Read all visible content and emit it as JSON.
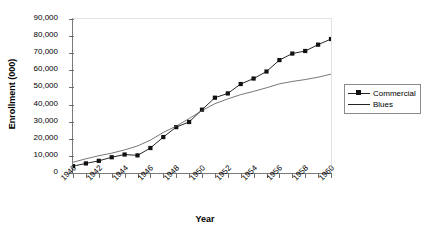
{
  "chart_data": {
    "type": "line",
    "title": "",
    "xlabel": "Year",
    "ylabel": "Enrollment (000)",
    "x": [
      1940,
      1941,
      1942,
      1943,
      1944,
      1945,
      1946,
      1947,
      1948,
      1949,
      1950,
      1951,
      1952,
      1953,
      1954,
      1955,
      1956,
      1957,
      1958,
      1959,
      1960
    ],
    "categories": [
      "1940",
      "1941",
      "1942",
      "1943",
      "1944",
      "1945",
      "1946",
      "1947",
      "1948",
      "1949",
      "1950",
      "1951",
      "1952",
      "1953",
      "1954",
      "1955",
      "1956",
      "1957",
      "1958",
      "1959",
      "1960"
    ],
    "xtick_labels": [
      "1940",
      "1942",
      "1944",
      "1946",
      "1948",
      "1950",
      "1952",
      "1954",
      "1956",
      "1958",
      "1960"
    ],
    "ytick_labels": [
      "0",
      "10,000",
      "20,000",
      "30,000",
      "40,000",
      "50,000",
      "60,000",
      "70,000",
      "80,000",
      "90,000"
    ],
    "ytick_values": [
      0,
      10000,
      20000,
      30000,
      40000,
      50000,
      60000,
      70000,
      80000,
      90000
    ],
    "xlim": [
      1940,
      1960
    ],
    "ylim": [
      0,
      90000
    ],
    "grid": false,
    "legend_position": "right",
    "series": [
      {
        "name": "Commercial",
        "marker": "square",
        "color": "#111111",
        "values": [
          4000,
          5600,
          7100,
          9200,
          10800,
          10300,
          14600,
          21000,
          26800,
          29800,
          37000,
          44000,
          46500,
          52000,
          55200,
          59300,
          66000,
          69800,
          71300,
          75000,
          78300
        ]
      },
      {
        "name": "Blues",
        "marker": "none",
        "color": "#555555",
        "values": [
          6300,
          8300,
          10100,
          11600,
          13500,
          15800,
          19200,
          23700,
          27400,
          31800,
          36500,
          40500,
          43300,
          45800,
          47700,
          49800,
          52100,
          53500,
          54600,
          56000,
          57800
        ]
      }
    ]
  },
  "legend": {
    "items": [
      {
        "label": "Commercial"
      },
      {
        "label": "Blues"
      }
    ]
  }
}
